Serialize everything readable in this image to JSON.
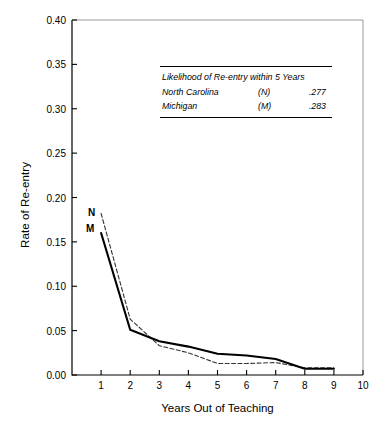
{
  "chart_data": {
    "type": "line",
    "title": "",
    "xlabel": "Years Out of Teaching",
    "ylabel": "Rate of Re-entry",
    "xlim": [
      0,
      10
    ],
    "ylim": [
      0.0,
      0.4
    ],
    "xticks": [
      "1",
      "2",
      "3",
      "4",
      "5",
      "6",
      "7",
      "8",
      "9",
      "10"
    ],
    "yticks": [
      "0.00",
      "0.05",
      "0.10",
      "0.15",
      "0.20",
      "0.25",
      "0.30",
      "0.35",
      "0.40"
    ],
    "grid": false,
    "legend_position": "inset-top-center",
    "x": [
      1,
      2,
      3,
      4,
      5,
      6,
      7,
      8,
      9
    ],
    "series": [
      {
        "name": "North Carolina",
        "key": "N",
        "style": "dashed",
        "color": "#333333",
        "values": [
          0.182,
          0.063,
          0.033,
          0.025,
          0.013,
          0.013,
          0.014,
          0.008,
          0.008
        ]
      },
      {
        "name": "Michigan",
        "key": "M",
        "style": "solid",
        "color": "#000000",
        "values": [
          0.16,
          0.051,
          0.038,
          0.032,
          0.024,
          0.022,
          0.018,
          0.007,
          0.007
        ]
      }
    ],
    "annotations": [
      {
        "text": "N",
        "x": 1,
        "y": 0.19
      },
      {
        "text": "M",
        "x": 1,
        "y": 0.167
      }
    ]
  },
  "legend": {
    "title": "Likelihood of Re-entry within 5 Years",
    "rows": [
      {
        "name": "North Carolina",
        "key": "(N)",
        "value": ".277"
      },
      {
        "name": "Michigan",
        "key": "(M)",
        "value": ".283"
      }
    ]
  },
  "axis": {
    "x_title": "Years Out of Teaching",
    "y_title": "Rate of Re-entry"
  },
  "markers": {
    "n": "N",
    "m": "M"
  },
  "colors": {
    "axis": "#000000",
    "series_solid": "#000000",
    "series_dashed": "#333333",
    "background": "#ffffff"
  }
}
